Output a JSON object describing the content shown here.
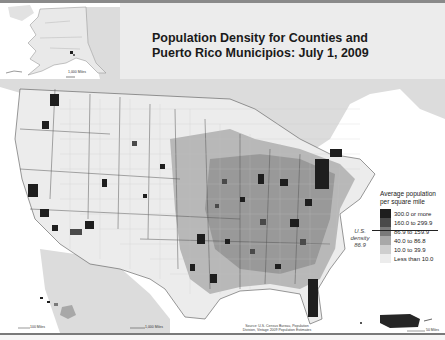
{
  "title": {
    "line1": "Population Density for Counties and",
    "line2": "Puerto Rico Municipios: July 1, 2009"
  },
  "legend": {
    "title_line1": "Average population",
    "title_line2": "per square mile",
    "items": [
      {
        "label": "300.0 or more",
        "color": "#1e1e1e"
      },
      {
        "label": "160.0 to 299.9",
        "color": "#4a4a4a"
      },
      {
        "label": "86.9 to 159.9",
        "color": "#7a7a7a"
      },
      {
        "label": "40.0 to 86.8",
        "color": "#a8a8a8"
      },
      {
        "label": "10.0 to 39.9",
        "color": "#cecece"
      },
      {
        "label": "Less than 10.0",
        "color": "#ececec"
      }
    ]
  },
  "us_density": {
    "line1": "U.S.",
    "line2": "density",
    "line3": "86.9"
  },
  "source": {
    "line1": "Source: U.S. Census Bureau, Population",
    "line2": "Division, Vintage 2009 Population Estimates"
  },
  "scales": {
    "alaska": "1,000 Miles",
    "hawaii": "100 Miles",
    "conus": "1,000 Miles",
    "puerto_rico": "50 Miles"
  },
  "insets": [
    "Alaska",
    "Hawaii",
    "Puerto Rico"
  ],
  "colors": {
    "water": "#ffffff",
    "canada_mexico": "#dcdcdc",
    "county_border": "#9a9a9a",
    "state_border": "#555555"
  }
}
